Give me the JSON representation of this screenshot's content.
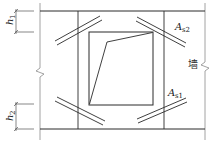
{
  "diagram": {
    "labels": {
      "h1": {
        "main": "h",
        "sub": "1"
      },
      "h2": {
        "main": "h",
        "sub": "2"
      },
      "As2": {
        "main": "A",
        "sub": "s2"
      },
      "As1": {
        "main": "A",
        "sub": "s1"
      },
      "wall": "墙"
    },
    "colors": {
      "line": "#2a2a2a",
      "thin_line": "#888888",
      "background": "#ffffff"
    }
  }
}
